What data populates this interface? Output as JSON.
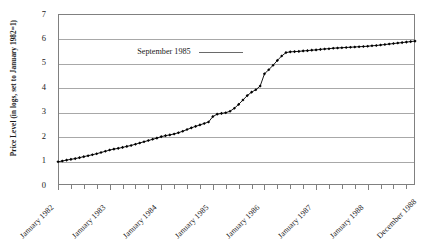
{
  "figure": {
    "name": "bolivia-hyperinflation-price-level-chart",
    "caption": "",
    "frame_color": "#808080",
    "grid_color": "#a8a8a8",
    "series_color": "#000000"
  },
  "annotation": {
    "label": "September 1985",
    "leader": "horizontal-leader-line"
  },
  "chart_data": {
    "type": "line",
    "title": "",
    "subtitle": "",
    "xlabel": "",
    "ylabel": "Price Level (in logs, set to January 1982=1)",
    "ylim": [
      0,
      7
    ],
    "ytick_labels": [
      "0",
      "1",
      "2",
      "3",
      "4",
      "5",
      "6",
      "7"
    ],
    "ytick_values": [
      0,
      1,
      2,
      3,
      4,
      5,
      6,
      7
    ],
    "grid": "horizontal",
    "legend": "none",
    "marker": "filled-diamond",
    "xtick_labels": [
      "January 1982",
      "January 1983",
      "January 1984",
      "January 1985",
      "January 1986",
      "January 1987",
      "January 1988",
      "December 1988"
    ],
    "xtick_positions": [
      0,
      12,
      24,
      36,
      48,
      60,
      72,
      83
    ],
    "x_minor_tick_interval_months": 3,
    "x_count": 84,
    "annotations": [
      {
        "text": "September 1985",
        "x": 44,
        "y": 5.45
      }
    ],
    "x": [
      "1982-01",
      "1982-02",
      "1982-03",
      "1982-04",
      "1982-05",
      "1982-06",
      "1982-07",
      "1982-08",
      "1982-09",
      "1982-10",
      "1982-11",
      "1982-12",
      "1983-01",
      "1983-02",
      "1983-03",
      "1983-04",
      "1983-05",
      "1983-06",
      "1983-07",
      "1983-08",
      "1983-09",
      "1983-10",
      "1983-11",
      "1983-12",
      "1984-01",
      "1984-02",
      "1984-03",
      "1984-04",
      "1984-05",
      "1984-06",
      "1984-07",
      "1984-08",
      "1984-09",
      "1984-10",
      "1984-11",
      "1984-12",
      "1985-01",
      "1985-02",
      "1985-03",
      "1985-04",
      "1985-05",
      "1985-06",
      "1985-07",
      "1985-08",
      "1985-09",
      "1985-10",
      "1985-11",
      "1985-12",
      "1986-01",
      "1986-02",
      "1986-03",
      "1986-04",
      "1986-05",
      "1986-06",
      "1986-07",
      "1986-08",
      "1986-09",
      "1986-10",
      "1986-11",
      "1986-12",
      "1987-01",
      "1987-02",
      "1987-03",
      "1987-04",
      "1987-05",
      "1987-06",
      "1987-07",
      "1987-08",
      "1987-09",
      "1987-10",
      "1987-11",
      "1987-12",
      "1988-01",
      "1988-02",
      "1988-03",
      "1988-04",
      "1988-05",
      "1988-06",
      "1988-07",
      "1988-08",
      "1988-09",
      "1988-10",
      "1988-11",
      "1988-12"
    ],
    "values": [
      0.95,
      0.98,
      1.02,
      1.05,
      1.08,
      1.12,
      1.16,
      1.2,
      1.24,
      1.28,
      1.33,
      1.38,
      1.43,
      1.47,
      1.5,
      1.54,
      1.58,
      1.62,
      1.67,
      1.72,
      1.77,
      1.82,
      1.87,
      1.92,
      1.98,
      2.02,
      2.05,
      2.09,
      2.14,
      2.2,
      2.27,
      2.34,
      2.4,
      2.46,
      2.52,
      2.58,
      2.8,
      2.9,
      2.93,
      2.96,
      3.02,
      3.14,
      3.3,
      3.48,
      3.66,
      3.8,
      3.9,
      4.05,
      4.55,
      4.72,
      4.9,
      5.1,
      5.28,
      5.42,
      5.45,
      5.46,
      5.47,
      5.49,
      5.5,
      5.52,
      5.53,
      5.55,
      5.57,
      5.58,
      5.6,
      5.61,
      5.62,
      5.63,
      5.64,
      5.65,
      5.66,
      5.67,
      5.68,
      5.7,
      5.71,
      5.73,
      5.75,
      5.77,
      5.79,
      5.81,
      5.83,
      5.85,
      5.87,
      5.89
    ]
  }
}
